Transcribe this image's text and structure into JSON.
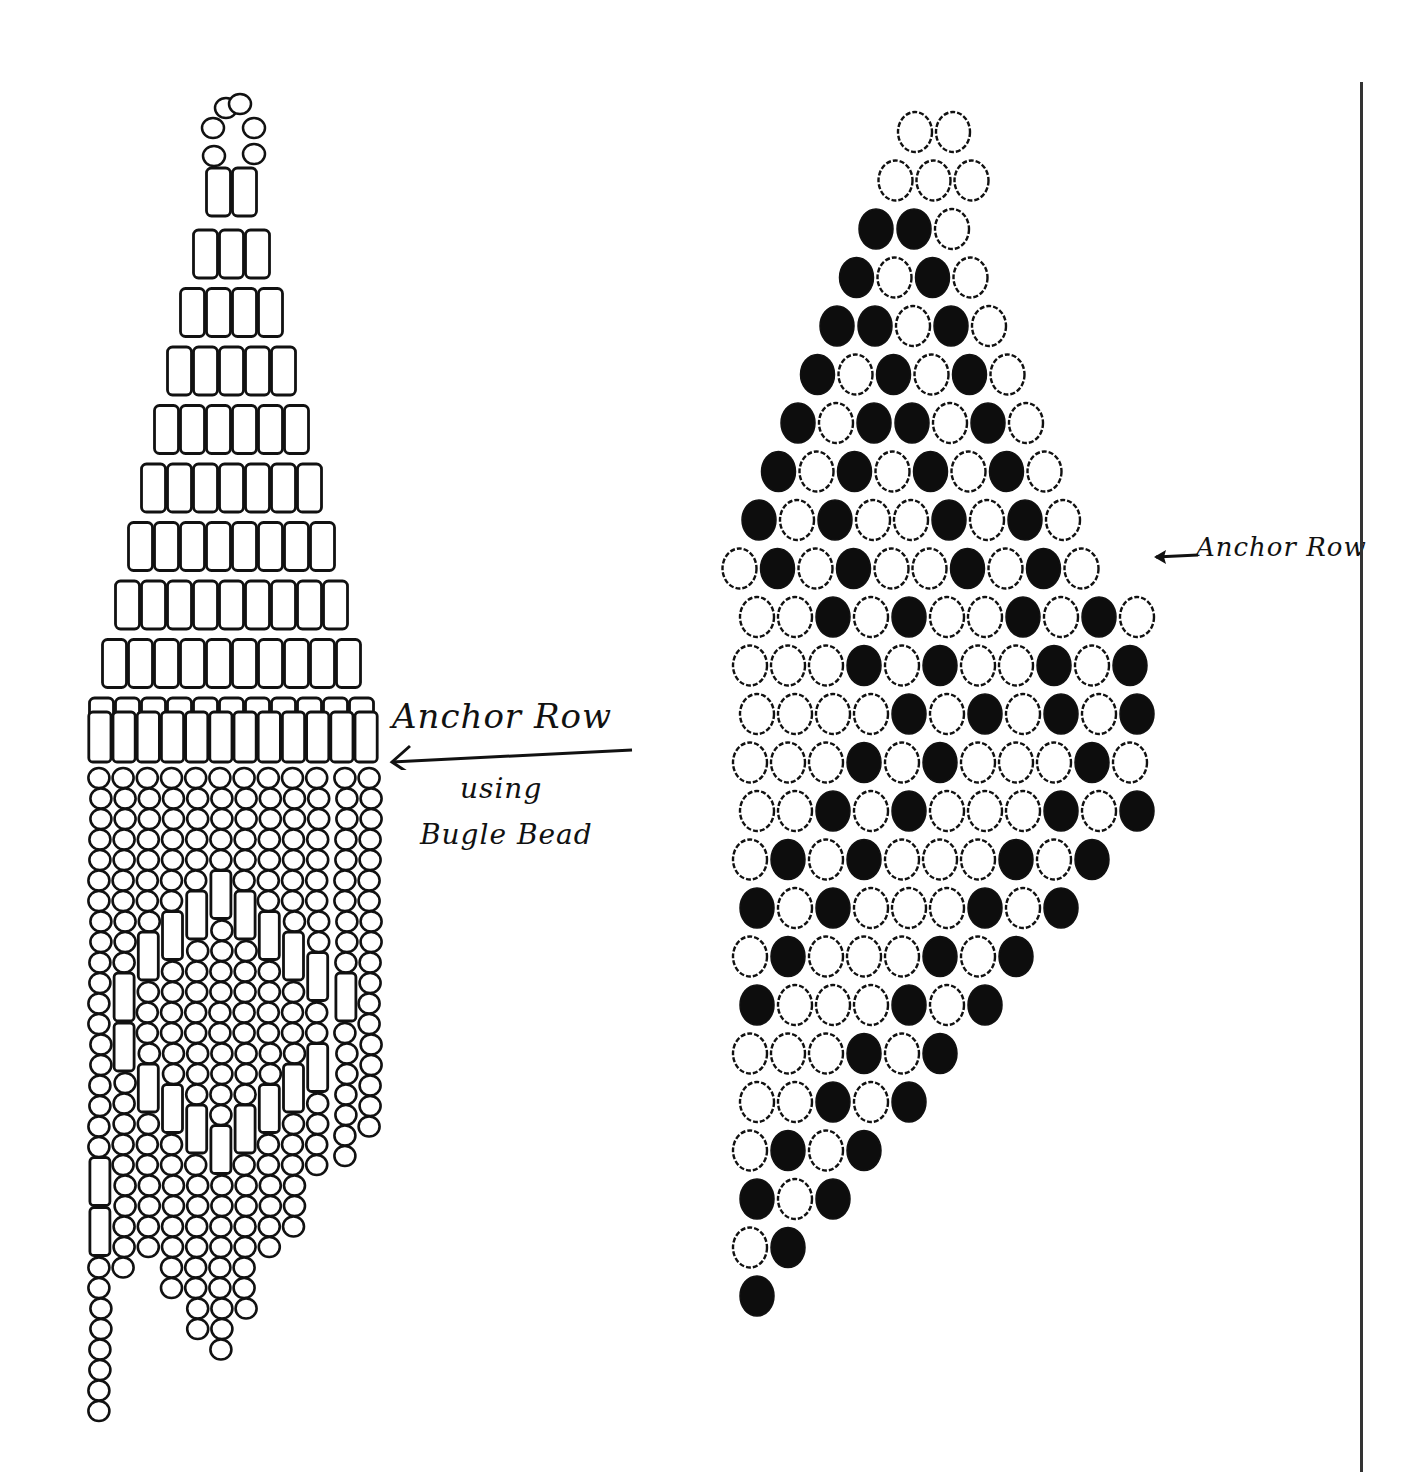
{
  "labels": {
    "left_anchor": "Anchor Row",
    "left_using": "using",
    "left_bugle": "Bugle Bead",
    "right_anchor": "Anchor Row"
  },
  "colors": {
    "ink": "#111111",
    "paper": "#ffffff",
    "dark_bead": "#0d0d0d"
  },
  "left_pattern": {
    "top_loop_beads": 6,
    "bugle_rows": [
      2,
      3,
      4,
      5,
      6,
      7,
      8,
      9,
      10,
      11
    ],
    "anchor_row_count": 12,
    "fringe": [
      "SSSSSSSSSSSSSSSSSSSBBSSSSSSSS",
      "SSSSSSSSSSBBSSSSSSSSSS",
      "SSSSSSSSBSSSSBSSSSSSS",
      "SSSSSSSBSSSSSSBSSSSSSSS",
      "SSSSSSBSSSSSSSSBSSSSSSSSS",
      "SSSSSBSSSSSSSSSSBSSSSSSSSS",
      "SSSSSSBSSSSSSSSBSSSSSSSS",
      "SSSSSSSBSSSSSSBSSSSSS",
      "SSSSSSSSBSSSSBSSSSSS",
      "SSSSSSSSSBSSBSSSS",
      "SSSSSSSSSSBSSSSSSS",
      "SSSSSSSSSSSSSSSSSS"
    ]
  },
  "right_pattern": {
    "legend": {
      "X": "dark bead",
      "O": "light bead"
    },
    "anchor_row_index": 9,
    "rows": [
      {
        "offset": 3.5,
        "beads": "OO"
      },
      {
        "offset": 3,
        "beads": "OOO"
      },
      {
        "offset": 2.5,
        "beads": "XXO"
      },
      {
        "offset": 2,
        "beads": "XOXO"
      },
      {
        "offset": 1.5,
        "beads": "XXOXO"
      },
      {
        "offset": 1,
        "beads": "XOXOXO"
      },
      {
        "offset": 0.5,
        "beads": "XOXXOXO"
      },
      {
        "offset": 0,
        "beads": "XOXOXOXO"
      },
      {
        "offset": -0.5,
        "beads": "XOXOOXOXO"
      },
      {
        "offset": -1,
        "beads": "OXOXOOXOXO"
      },
      {
        "offset": -0.5,
        "beads": "OOXOXOOXOXO"
      },
      {
        "offset": -1,
        "beads": "OOOXOXOOXOX"
      },
      {
        "offset": -1,
        "beads": "OOOOXOXOXOX"
      },
      {
        "offset": -1,
        "beads": "OOOXOXOOOXO"
      },
      {
        "offset": -1,
        "beads": "OOXOXOOOXOX"
      },
      {
        "offset": -1,
        "beads": "OXOXOOOXOX"
      },
      {
        "offset": -1,
        "beads": "XOXOOOXOX"
      },
      {
        "offset": -1,
        "beads": "OXOOOXOX"
      },
      {
        "offset": -1,
        "beads": "XOOOXOX"
      },
      {
        "offset": -1,
        "beads": "OOOXOX"
      },
      {
        "offset": -1,
        "beads": "OOXOX"
      },
      {
        "offset": -1,
        "beads": "OXOX"
      },
      {
        "offset": -1,
        "beads": "XOX"
      },
      {
        "offset": -0.9,
        "beads": "OX"
      },
      {
        "offset": -0.9,
        "beads": "X"
      }
    ]
  }
}
